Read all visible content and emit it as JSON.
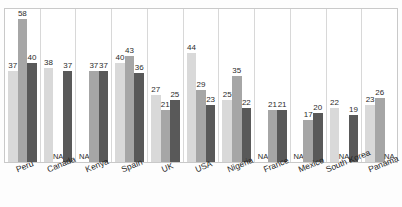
{
  "chart_data": {
    "type": "bar",
    "title": "",
    "subtitle": "",
    "xlabel": "",
    "ylabel": "",
    "ylim": [
      0,
      62
    ],
    "grid": false,
    "legend_position": "none",
    "categories": [
      "Peru",
      "Canada",
      "Kenya",
      "Spain",
      "UK",
      "USA",
      "Nigeria",
      "France",
      "Mexico",
      "South Korea",
      "Panama"
    ],
    "na_text": "NA",
    "series": [
      {
        "name": "Series 1",
        "color": "#d9d9d9",
        "values": [
          37,
          38,
          null,
          40,
          27,
          44,
          25,
          null,
          null,
          22,
          23
        ]
      },
      {
        "name": "Series 2",
        "color": "#a6a6a6",
        "values": [
          58,
          null,
          37,
          43,
          21,
          29,
          35,
          21,
          17,
          null,
          26
        ]
      },
      {
        "name": "Series 3",
        "color": "#595959",
        "values": [
          40,
          37,
          37,
          36,
          25,
          23,
          22,
          21,
          20,
          19,
          null
        ]
      }
    ]
  }
}
